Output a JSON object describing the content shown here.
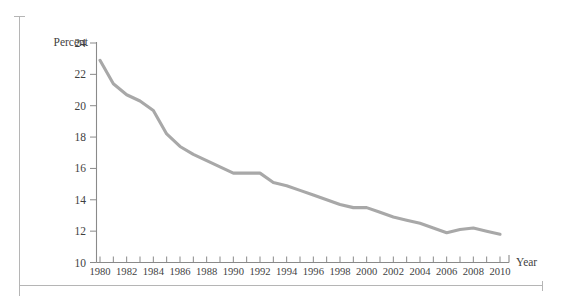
{
  "chart_data": {
    "type": "line",
    "title": "",
    "subtitle": "",
    "xlabel": "Year",
    "ylabel": "Percent",
    "xlim": [
      1980,
      2010
    ],
    "ylim": [
      10,
      24
    ],
    "grid": false,
    "legend": null,
    "line_color": "#a8a8a8",
    "axis_color": "#8a8a8a",
    "y_ticks": [
      10,
      12,
      14,
      16,
      18,
      20,
      22,
      24
    ],
    "y_tick_labels": [
      "10",
      "12",
      "14",
      "16",
      "18",
      "20",
      "22",
      "24"
    ],
    "x_ticks": [
      1980,
      1981,
      1982,
      1983,
      1984,
      1985,
      1986,
      1987,
      1988,
      1989,
      1990,
      1991,
      1992,
      1993,
      1994,
      1995,
      1996,
      1997,
      1998,
      1999,
      2000,
      2001,
      2002,
      2003,
      2004,
      2005,
      2006,
      2007,
      2008,
      2009,
      2010
    ],
    "x_tick_labels": [
      "1980",
      "",
      "1982",
      "",
      "1984",
      "",
      "1986",
      "",
      "1988",
      "",
      "1990",
      "",
      "1992",
      "",
      "1994",
      "",
      "1996",
      "",
      "1998",
      "",
      "2000",
      "",
      "2002",
      "",
      "2004",
      "",
      "2006",
      "",
      "2008",
      "",
      "2010"
    ],
    "x": [
      1980,
      1981,
      1982,
      1983,
      1984,
      1985,
      1986,
      1987,
      1988,
      1989,
      1990,
      1991,
      1992,
      1993,
      1994,
      1995,
      1996,
      1997,
      1998,
      1999,
      2000,
      2001,
      2002,
      2003,
      2004,
      2005,
      2006,
      2007,
      2008,
      2009,
      2010
    ],
    "values": [
      22.9,
      21.4,
      20.7,
      20.3,
      19.7,
      18.2,
      17.4,
      16.9,
      16.5,
      16.1,
      15.7,
      15.7,
      15.7,
      15.1,
      14.9,
      14.6,
      14.3,
      14.0,
      13.7,
      13.5,
      13.5,
      13.2,
      12.9,
      12.7,
      12.5,
      12.2,
      11.9,
      12.1,
      12.2,
      12.0,
      11.8
    ],
    "series": [
      {
        "name": "Percent",
        "values": [
          22.9,
          21.4,
          20.7,
          20.3,
          19.7,
          18.2,
          17.4,
          16.9,
          16.5,
          16.1,
          15.7,
          15.7,
          15.7,
          15.1,
          14.9,
          14.6,
          14.3,
          14.0,
          13.7,
          13.5,
          13.5,
          13.2,
          12.9,
          12.7,
          12.5,
          12.2,
          11.9,
          12.1,
          12.2,
          12.0,
          11.8
        ]
      }
    ]
  },
  "labels": {
    "y_axis_title": "Percent",
    "x_axis_title": "Year"
  }
}
